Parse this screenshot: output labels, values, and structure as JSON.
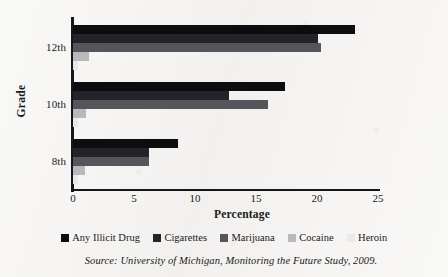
{
  "chart_data": {
    "type": "bar",
    "orientation": "horizontal",
    "title": "",
    "xlabel": "Percentage",
    "ylabel": "Grade",
    "xlim": [
      0,
      25
    ],
    "xticks": [
      0,
      5,
      10,
      15,
      20,
      25
    ],
    "categories": [
      "12th",
      "10th",
      "8th"
    ],
    "grid": false,
    "legend_position": "bottom",
    "series": [
      {
        "name": "Any Illicit Drug",
        "color": "#0d0d10",
        "values": [
          23.1,
          17.4,
          8.6
        ]
      },
      {
        "name": "Cigarettes",
        "color": "#23232a",
        "values": [
          20.1,
          12.8,
          6.2
        ]
      },
      {
        "name": "Marijuana",
        "color": "#55555c",
        "values": [
          20.3,
          16.0,
          6.2
        ]
      },
      {
        "name": "Cocaine",
        "color": "#b9b9bd",
        "values": [
          1.3,
          1.1,
          1.0
        ]
      },
      {
        "name": "Heroin",
        "color": "#e9e9ea",
        "values": [
          0.4,
          0.4,
          0.4
        ]
      }
    ],
    "source": "Source: University of Michigan, Monitoring the Future Study, 2009."
  },
  "axis": {
    "x_title": "Percentage",
    "y_title": "Grade",
    "x_tick_labels": [
      "0",
      "5",
      "10",
      "15",
      "20",
      "25"
    ],
    "y_tick_labels": [
      "12th",
      "10th",
      "8th"
    ]
  },
  "legend": {
    "items": [
      {
        "label": "Any Illicit Drug"
      },
      {
        "label": "Cigarettes"
      },
      {
        "label": "Marijuana"
      },
      {
        "label": "Cocaine"
      },
      {
        "label": "Heroin"
      }
    ]
  },
  "footer": {
    "source": "Source: University of Michigan, Monitoring the Future Study, 2009."
  }
}
